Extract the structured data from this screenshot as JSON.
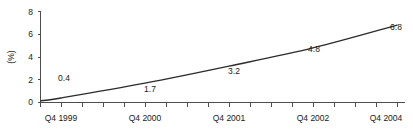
{
  "chart_data": {
    "type": "line",
    "title": "",
    "subtitle": "",
    "xlabel": "",
    "ylabel": "(%)",
    "ylim": [
      0,
      8
    ],
    "yticks": [
      0,
      2,
      4,
      6,
      8
    ],
    "ytick_labels": [
      "0",
      "2",
      "4",
      "6",
      "8"
    ],
    "grid": false,
    "legend": "none",
    "x_axis_minor_ticks": 17,
    "categories": [
      "Q4 1999",
      "Q4 2000",
      "Q4 2001",
      "Q4 2002",
      "Q4 2004"
    ],
    "tick_labels": [
      "Q4 1999",
      "Q4 2000",
      "Q4 2001",
      "Q4 2002",
      "Q4 2004"
    ],
    "series": [
      {
        "name": "",
        "values": [
          0.4,
          1.7,
          3.2,
          4.8,
          6.8
        ],
        "point_labels": [
          "0.4",
          "1.7",
          "3.2",
          "4.8",
          "6.8"
        ]
      }
    ],
    "annotations": [
      {
        "text": "0.4",
        "value": 0.4,
        "category": "Q4 1999"
      },
      {
        "text": "1.7",
        "value": 1.7,
        "category": "Q4 2000"
      },
      {
        "text": "3.2",
        "value": 3.2,
        "category": "Q4 2001"
      },
      {
        "text": "4.8",
        "value": 4.8,
        "category": "Q4 2002"
      },
      {
        "text": "6.8",
        "value": 6.8,
        "category": "Q4 2004"
      }
    ],
    "colors": {
      "line": "#2b2b2b",
      "axis": "#4d4d4d",
      "text": "#1a1a1a",
      "background": "#ffffff"
    }
  }
}
